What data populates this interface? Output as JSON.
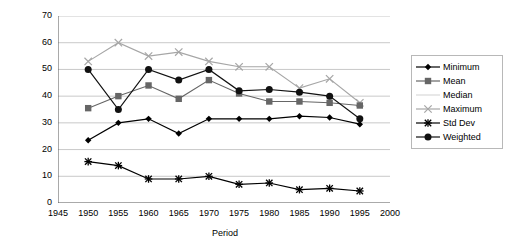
{
  "chart_data": {
    "type": "line",
    "title": "",
    "xlabel": "Period",
    "ylabel": "Gini coefficient",
    "xlim": [
      1945,
      2000
    ],
    "ylim": [
      0,
      70
    ],
    "ytick_step": 10,
    "xtick_step": 5,
    "grid": true,
    "legend_position": "right",
    "x": [
      1950,
      1955,
      1960,
      1965,
      1970,
      1975,
      1980,
      1985,
      1990,
      1995
    ],
    "xticks": [
      "1945",
      "1950",
      "1955",
      "1960",
      "1965",
      "1970",
      "1975",
      "1980",
      "1985",
      "1990",
      "1995",
      "2000"
    ],
    "yticks": [
      "0",
      "10",
      "20",
      "30",
      "40",
      "50",
      "60",
      "70"
    ],
    "series": [
      {
        "name": "Minimum",
        "marker": "diamond",
        "color": "#000000",
        "values": [
          23.5,
          30.0,
          31.5,
          26.0,
          31.5,
          31.5,
          31.5,
          32.5,
          32.0,
          29.5
        ]
      },
      {
        "name": "Mean",
        "marker": "square",
        "color": "#666666",
        "values": [
          35.5,
          40.0,
          44.0,
          39.0,
          46.0,
          41.0,
          38.0,
          38.0,
          37.5,
          36.5
        ]
      },
      {
        "name": "Median",
        "marker": "none",
        "color": "#d9d9d9",
        "values": [
          null,
          null,
          null,
          null,
          null,
          null,
          null,
          null,
          null,
          null
        ]
      },
      {
        "name": "Maximum",
        "marker": "cross-x",
        "color": "#a6a6a6",
        "values": [
          53.0,
          60.0,
          55.0,
          56.5,
          53.0,
          51.0,
          51.0,
          43.0,
          46.5,
          37.5
        ]
      },
      {
        "name": "Std Dev",
        "marker": "star",
        "color": "#000000",
        "values": [
          15.5,
          14.0,
          9.0,
          9.0,
          10.0,
          7.0,
          7.5,
          5.0,
          5.5,
          4.5
        ]
      },
      {
        "name": "Weighted",
        "marker": "circle",
        "color": "#111111",
        "values": [
          50.0,
          35.0,
          50.0,
          46.0,
          50.0,
          42.0,
          42.5,
          41.5,
          40.0,
          31.5
        ]
      }
    ]
  },
  "legend": {
    "entries": [
      {
        "label": "Minimum"
      },
      {
        "label": "Mean"
      },
      {
        "label": "Median"
      },
      {
        "label": "Maximum"
      },
      {
        "label": "Std Dev"
      },
      {
        "label": "Weighted"
      }
    ]
  },
  "axes": {
    "x_title": "Period",
    "y_title": "Gini coefficient"
  }
}
